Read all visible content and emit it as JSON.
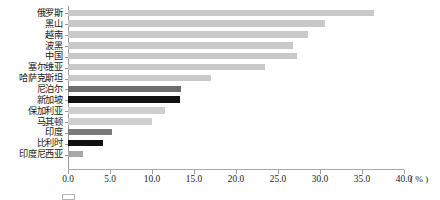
{
  "chart_data": {
    "type": "bar",
    "orientation": "horizontal",
    "title": "",
    "xlabel": "( % )",
    "ylabel": "",
    "xlim": [
      0.0,
      40.0
    ],
    "grid": false,
    "legend_position": "bottom",
    "categories": [
      "俄罗斯",
      "黑山",
      "越南",
      "波黑",
      "中国",
      "塞尔维亚",
      "哈萨克斯坦",
      "尼泊尔",
      "新加坡",
      "保加利亚",
      "马其顿",
      "印度",
      "比利时",
      "印度尼西亚"
    ],
    "values": [
      36.4,
      30.6,
      28.6,
      26.8,
      27.3,
      23.4,
      17.0,
      13.4,
      13.3,
      11.5,
      10.0,
      5.2,
      4.2,
      1.8
    ],
    "bar_colors": [
      "#c9c9c9",
      "#c9c9c9",
      "#c9c9c9",
      "#c9c9c9",
      "#c9c9c9",
      "#c9c9c9",
      "#c9c9c9",
      "#6e6e6e",
      "#111111",
      "#cfcfcf",
      "#cfcfcf",
      "#7a7a7a",
      "#111111",
      "#a8a8a8"
    ],
    "x_ticks": [
      {
        "value": 0.0,
        "label": "0.0"
      },
      {
        "value": 5.0,
        "label": "5.0"
      },
      {
        "value": 10.0,
        "label": "10.0"
      },
      {
        "value": 15.0,
        "label": "15.0"
      },
      {
        "value": 20.0,
        "label": "20.0"
      },
      {
        "value": 25.0,
        "label": "25.0"
      },
      {
        "value": 30.0,
        "label": "30.0"
      },
      {
        "value": 35.0,
        "label": "35.0"
      },
      {
        "value": 40.0,
        "label": "40.0"
      }
    ],
    "unit_label": "( % )",
    "colors": {
      "axis": "#a0a0a0",
      "text": "#1a1a1a",
      "light_bar": "#c9c9c9",
      "mid_bar": "#7a7a7a",
      "dark_bar": "#111111",
      "background": "#ffffff"
    }
  },
  "legend": {
    "cropped": true,
    "text": ""
  }
}
